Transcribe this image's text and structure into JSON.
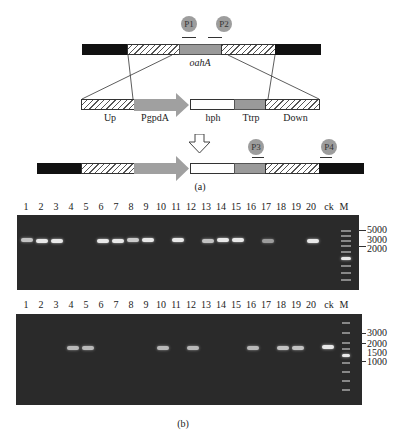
{
  "panel_a": {
    "primers": {
      "p1": "P1",
      "p2": "P2",
      "p3": "P3",
      "p4": "P4"
    },
    "gene_label": "oahA",
    "construct_labels": {
      "up": "Up",
      "pgpda": "PgpdA",
      "hph": "hph",
      "ttrp": "Ttrp",
      "down": "Down"
    },
    "caption": "(a)"
  },
  "panel_b": {
    "gel1": {
      "lanes": [
        "1",
        "2",
        "3",
        "4",
        "5",
        "6",
        "7",
        "8",
        "9",
        "10",
        "11",
        "12",
        "13",
        "14",
        "15",
        "16",
        "17",
        "18",
        "19",
        "20",
        "ck",
        "M"
      ],
      "bands_present": [
        1,
        2,
        3,
        6,
        7,
        8,
        9,
        11,
        13,
        14,
        15,
        17,
        20
      ],
      "size_markers": [
        "5000",
        "3000",
        "2000"
      ]
    },
    "gel2": {
      "lanes": [
        "1",
        "2",
        "3",
        "4",
        "5",
        "6",
        "7",
        "8",
        "9",
        "10",
        "11",
        "12",
        "13",
        "14",
        "15",
        "16",
        "17",
        "18",
        "19",
        "20",
        "ck",
        "M"
      ],
      "bands_present": [
        4,
        5,
        10,
        12,
        16,
        18,
        19,
        "ck"
      ],
      "size_markers": [
        "3000",
        "2000",
        "1500",
        "1000"
      ]
    },
    "caption": "(b)"
  },
  "colors": {
    "gel_bg": "#2a2a2a",
    "band": "#e8e8e8",
    "arrow_grey": "#a0a0a0",
    "black_segment": "#111111"
  }
}
